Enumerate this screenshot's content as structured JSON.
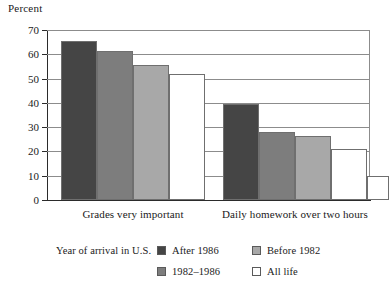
{
  "chart_data": {
    "type": "bar",
    "title": "",
    "ylabel": "Percent",
    "xlabel": "",
    "ylim": [
      0,
      70
    ],
    "yticks": [
      0,
      10,
      20,
      30,
      40,
      50,
      60,
      70
    ],
    "ytick_labels": [
      "0",
      "10",
      "20",
      "30",
      "40",
      "50",
      "60",
      "70"
    ],
    "grid": true,
    "legend_position": "bottom",
    "legend_title": "Year of arrival in U.S.",
    "categories": [
      "Grades very important",
      "Daily homework over two hours"
    ],
    "series": [
      {
        "name": "After 1986",
        "color": "#454545",
        "values": [
          65.5,
          39.5
        ]
      },
      {
        "name": "1982–1986",
        "color": "#7d7d7d",
        "values": [
          61.5,
          28.0
        ]
      },
      {
        "name": "Before 1982",
        "color": "#a8a8a8",
        "values": [
          55.5,
          26.5
        ]
      },
      {
        "name": "All life",
        "color": "#ffffff",
        "values": [
          52.0,
          21.0
        ]
      },
      {
        "name": "",
        "color": "#ffffff",
        "values": [
          null,
          10.0
        ]
      }
    ]
  },
  "axis": {
    "y_title": "Percent"
  },
  "legend": {
    "title": "Year of arrival in U.S.",
    "items": [
      {
        "label": "After 1986",
        "color": "#454545"
      },
      {
        "label": "Before 1982",
        "color": "#a8a8a8"
      },
      {
        "label": "1982–1986",
        "color": "#7d7d7d"
      },
      {
        "label": "All life",
        "color": "#ffffff"
      }
    ]
  },
  "categories": [
    {
      "label": "Grades very important"
    },
    {
      "label": "Daily homework over two hours"
    }
  ]
}
